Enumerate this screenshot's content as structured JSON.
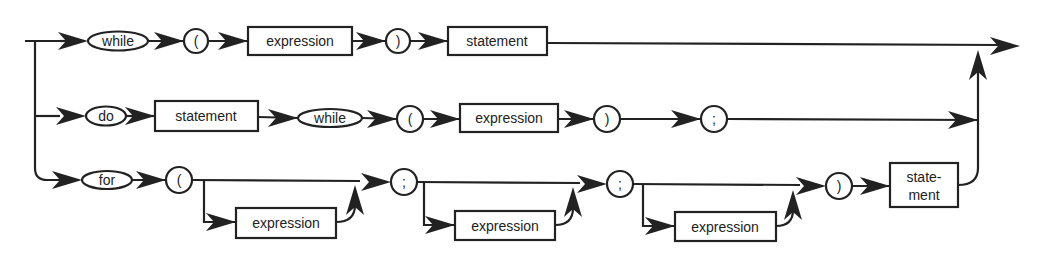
{
  "diagram": {
    "type": "syntax-diagram",
    "rows": [
      {
        "name": "while-statement",
        "tokens": [
          {
            "kind": "terminal",
            "label": "while"
          },
          {
            "kind": "terminal",
            "label": "("
          },
          {
            "kind": "nonterminal",
            "label": "expression"
          },
          {
            "kind": "terminal",
            "label": ")"
          },
          {
            "kind": "nonterminal",
            "label": "statement"
          }
        ]
      },
      {
        "name": "do-while-statement",
        "tokens": [
          {
            "kind": "terminal",
            "label": "do"
          },
          {
            "kind": "nonterminal",
            "label": "statement"
          },
          {
            "kind": "terminal",
            "label": "while"
          },
          {
            "kind": "terminal",
            "label": "("
          },
          {
            "kind": "nonterminal",
            "label": "expression"
          },
          {
            "kind": "terminal",
            "label": ")"
          },
          {
            "kind": "terminal",
            "label": ";"
          }
        ]
      },
      {
        "name": "for-statement",
        "tokens": [
          {
            "kind": "terminal",
            "label": "for"
          },
          {
            "kind": "terminal",
            "label": "("
          },
          {
            "kind": "optional-nonterminal",
            "label": "expression"
          },
          {
            "kind": "terminal",
            "label": ";"
          },
          {
            "kind": "optional-nonterminal",
            "label": "expression"
          },
          {
            "kind": "terminal",
            "label": ";"
          },
          {
            "kind": "optional-nonterminal",
            "label": "expression"
          },
          {
            "kind": "terminal",
            "label": ")"
          },
          {
            "kind": "nonterminal",
            "label": "state-\nment",
            "line1": "state-",
            "line2": "ment"
          }
        ]
      }
    ]
  },
  "labels": {
    "while": "while",
    "do": "do",
    "for": "for",
    "lparen": "(",
    "rparen": ")",
    "semicolon": ";",
    "expression": "expression",
    "statement": "statement",
    "statement_split_1": "state-",
    "statement_split_2": "ment"
  },
  "colors": {
    "stroke": "#222222",
    "background": "#ffffff"
  }
}
